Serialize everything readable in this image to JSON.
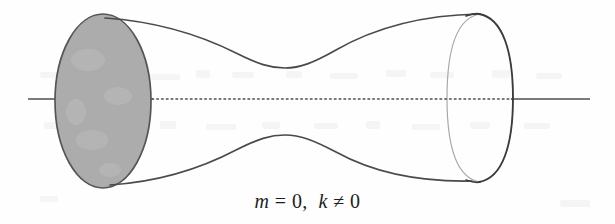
{
  "figure": {
    "caption": "m = 0,  k ≠ 0",
    "caption_parts": {
      "var_m": "m",
      "eq": " = ",
      "zero_1": "0",
      "comma": ",  ",
      "var_k": "k",
      "neq": " ≠ ",
      "zero_2": "0"
    },
    "title": "",
    "alt": "Surface of revolution with a shaded disk cap on the left end, a narrow waist in the middle, and an open circular end on the right, with a dash-dot axis of revolution"
  },
  "colors": {
    "background": "#fefefe",
    "outline": "#4a4a4a",
    "outline_dark": "#3c3c3c",
    "outline_faint": "#9d9d9d",
    "disk_fill": "#acacac",
    "disk_stroke": "#555555",
    "axis": "#4f4f4f",
    "caption_text": "#1d1d1d"
  },
  "geometry": {
    "canvas": {
      "width": 615,
      "height": 224
    },
    "axis": {
      "y": 99,
      "solid_left": {
        "x1": 28,
        "x2": 152
      },
      "dotted": {
        "x1": 152,
        "x2": 512
      },
      "solid_right": {
        "x1": 512,
        "x2": 590
      },
      "dash_pattern": "1,3"
    },
    "left_cap_ellipse": {
      "cx": 103,
      "cy": 101,
      "rx": 48,
      "ry": 87
    },
    "right_end_ellipse": {
      "cx": 480,
      "cy": 98,
      "rx": 33,
      "ry": 84
    },
    "waist": {
      "x": 285,
      "top_y": 68,
      "bottom_y": 135
    },
    "profile_top": {
      "start": {
        "x": 105,
        "y": 18
      },
      "end": {
        "x": 479,
        "y": 14
      }
    },
    "profile_bottom": {
      "start": {
        "x": 110,
        "y": 185
      },
      "end": {
        "x": 472,
        "y": 181
      }
    }
  },
  "elements": {
    "left_disk_label": "shaded disk cap",
    "right_opening_label": "open tube end",
    "axis_label": "axis of revolution",
    "surface_label": "surface of revolution"
  }
}
